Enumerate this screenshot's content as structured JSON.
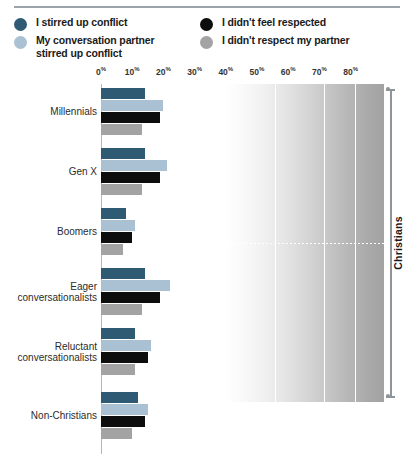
{
  "legend": {
    "items": [
      {
        "key": "stirred-self",
        "label": "I stirred up conflict",
        "color": "#2f5a74",
        "column": "left"
      },
      {
        "key": "stirred-partner",
        "label": "My conversation partner\nstirred up conflict",
        "color": "#a9c1d2",
        "column": "left"
      },
      {
        "key": "not-respected",
        "label": "I didn't feel respected",
        "color": "#0d0d0d",
        "column": "right"
      },
      {
        "key": "didnt-respect",
        "label": "I didn't respect my partner",
        "color": "#a3a3a3",
        "column": "right"
      }
    ]
  },
  "bracket": {
    "label": "Christians"
  },
  "chart_data": {
    "type": "bar",
    "title": "",
    "xlabel": "",
    "ylabel": "",
    "orientation": "horizontal",
    "grid": true,
    "legend_position": "top",
    "xlim": [
      0,
      80
    ],
    "xticks": [
      0,
      10,
      20,
      30,
      40,
      50,
      60,
      70,
      80
    ],
    "xtick_labels": [
      "0%",
      "10%",
      "20%",
      "30%",
      "40%",
      "50%",
      "60%",
      "70%",
      "80%"
    ],
    "categories": [
      "Millennials",
      "Gen X",
      "Boomers",
      "Eager\nconversationalists",
      "Reluctant\nconversationalists",
      "Non-Christians"
    ],
    "series": [
      {
        "name": "I stirred up conflict",
        "color": "#2f5a74",
        "values": [
          14,
          14,
          8,
          14,
          11,
          12
        ]
      },
      {
        "name": "My conversation partner stirred up conflict",
        "color": "#a9c1d2",
        "values": [
          20,
          21,
          11,
          22,
          16,
          15
        ]
      },
      {
        "name": "I didn't feel respected",
        "color": "#0d0d0d",
        "values": [
          19,
          19,
          10,
          19,
          15,
          14
        ]
      },
      {
        "name": "I didn't respect my partner",
        "color": "#a3a3a3",
        "values": [
          13,
          13,
          7,
          13,
          11,
          10
        ]
      }
    ],
    "annotations": [
      {
        "text": "Christians",
        "type": "bracket",
        "covers": [
          "Millennials",
          "Gen X",
          "Boomers",
          "Eager\nconversationalists",
          "Reluctant\nconversationalists"
        ]
      }
    ]
  }
}
